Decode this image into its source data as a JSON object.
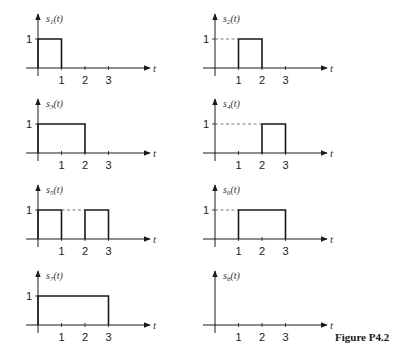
{
  "figure_label": "Figure P4.2",
  "axis": {
    "x_label": "t",
    "y_level_label": "1",
    "ticks": [
      "1",
      "2",
      "3"
    ]
  },
  "chart_data": {
    "type": "line",
    "title": "Figure P4.2",
    "xlabel": "t",
    "ylabel": "s_i(t)",
    "xlim": [
      0,
      3
    ],
    "ylim": [
      0,
      1
    ],
    "x_ticks": [
      1,
      2,
      3
    ],
    "y_ticks": [
      1
    ],
    "series": [
      {
        "name": "s1(t)",
        "label": "s",
        "sub": "1",
        "segments": [
          [
            0,
            1
          ]
        ],
        "x": [
          0,
          0,
          1,
          1
        ],
        "y": [
          0,
          1,
          1,
          0
        ]
      },
      {
        "name": "s2(t)",
        "label": "s",
        "sub": "2",
        "segments": [
          [
            1,
            2
          ]
        ],
        "x": [
          1,
          1,
          2,
          2
        ],
        "y": [
          0,
          1,
          1,
          0
        ]
      },
      {
        "name": "s3(t)",
        "label": "s",
        "sub": "3",
        "segments": [
          [
            0,
            2
          ]
        ],
        "x": [
          0,
          0,
          2,
          2
        ],
        "y": [
          0,
          1,
          1,
          0
        ]
      },
      {
        "name": "s4(t)",
        "label": "s",
        "sub": "4",
        "segments": [
          [
            2,
            3
          ]
        ],
        "x": [
          2,
          2,
          3,
          3
        ],
        "y": [
          0,
          1,
          1,
          0
        ]
      },
      {
        "name": "s5(t)",
        "label": "s",
        "sub": "5",
        "segments": [
          [
            0,
            1
          ],
          [
            2,
            3
          ]
        ],
        "x": [
          0,
          0,
          1,
          1,
          2,
          2,
          3,
          3
        ],
        "y": [
          0,
          1,
          1,
          0,
          0,
          1,
          1,
          0
        ]
      },
      {
        "name": "s6(t)",
        "label": "s",
        "sub": "6",
        "segments": [
          [
            1,
            3
          ]
        ],
        "x": [
          1,
          1,
          3,
          3
        ],
        "y": [
          0,
          1,
          1,
          0
        ]
      },
      {
        "name": "s7(t)",
        "label": "s",
        "sub": "7",
        "segments": [
          [
            0,
            3
          ]
        ],
        "x": [
          0,
          0,
          3,
          3
        ],
        "y": [
          0,
          1,
          1,
          0
        ]
      },
      {
        "name": "s8(t)",
        "label": "s",
        "sub": "8",
        "segments": [],
        "x": [
          0,
          3
        ],
        "y": [
          0,
          0
        ]
      }
    ]
  }
}
